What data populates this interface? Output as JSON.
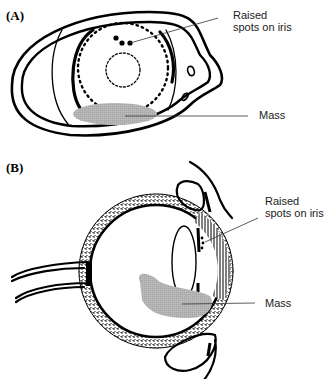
{
  "figure": {
    "panels": [
      {
        "label": "(A)",
        "view": "frontal view of eye",
        "annotations": [
          {
            "id": "raised-spots",
            "lines": [
              "Raised",
              "spots on iris"
            ]
          },
          {
            "id": "mass",
            "lines": [
              "Mass"
            ]
          }
        ]
      },
      {
        "label": "(B)",
        "view": "cross-sectional side view of eye",
        "annotations": [
          {
            "id": "raised-spots",
            "lines": [
              "Raised",
              "spots on iris"
            ]
          },
          {
            "id": "mass",
            "lines": [
              "Mass"
            ]
          }
        ]
      }
    ],
    "colors": {
      "ink": "#000000",
      "mass_fill": "#b8b8b8",
      "leader": "#333333",
      "background": "#ffffff"
    }
  }
}
